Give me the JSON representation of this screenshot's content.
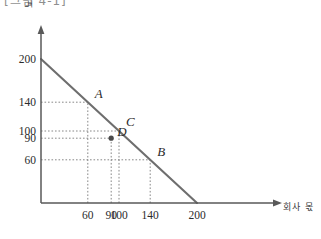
{
  "page": {
    "clipped_header_text": "[그림 4-1]"
  },
  "chart_data": {
    "type": "line",
    "title": "",
    "xlabel": "회사 몫",
    "ylabel": "노조 몫",
    "xlim": [
      0,
      215
    ],
    "ylim": [
      0,
      215
    ],
    "grid": false,
    "legend": "none",
    "series": [
      {
        "name": "bargaining-frontier",
        "type": "line",
        "x": [
          0,
          200
        ],
        "values": [
          200,
          0
        ],
        "color": "#6e6e6e"
      }
    ],
    "xticks": [
      60,
      90,
      100,
      140,
      200
    ],
    "xticklabels": [
      "60",
      "90",
      "100",
      "140",
      "200"
    ],
    "yticks": [
      60,
      90,
      100,
      140,
      200
    ],
    "yticklabels": [
      "60",
      "90",
      "100",
      "140",
      "200"
    ],
    "annotations": [
      {
        "label": "A",
        "x": 60,
        "y": 140,
        "on_line": true,
        "marker": false,
        "dx": 7,
        "dy": -12
      },
      {
        "label": "C",
        "x": 100,
        "y": 100,
        "on_line": true,
        "marker": false,
        "dx": 7,
        "dy": -13
      },
      {
        "label": "B",
        "x": 140,
        "y": 60,
        "on_line": true,
        "marker": false,
        "dx": 7,
        "dy": -12
      },
      {
        "label": "D",
        "x": 90,
        "y": 90,
        "on_line": false,
        "marker": true,
        "dx": 6,
        "dy": -10
      }
    ],
    "guide_lines": [
      {
        "point": "A",
        "x": 60,
        "y": 140
      },
      {
        "point": "C",
        "x": 100,
        "y": 100
      },
      {
        "point": "D",
        "x": 90,
        "y": 90
      },
      {
        "point": "B",
        "x": 140,
        "y": 60
      }
    ],
    "colors": {
      "axis": "#595959",
      "line": "#6e6e6e",
      "guide": "#7a7a7a",
      "text": "#2b2b2b",
      "marker": "#4a4a4a"
    }
  }
}
